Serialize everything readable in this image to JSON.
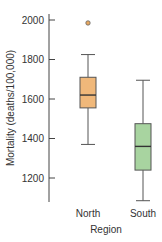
{
  "chart_data": {
    "type": "box",
    "title": "",
    "xlabel": "Region",
    "ylabel": "Mortality (deaths/100,000)",
    "ylim": [
      1080,
      2030
    ],
    "yticks": [
      1200,
      1400,
      1600,
      1800,
      2000
    ],
    "grid": false,
    "legend": null,
    "categories": [
      "North",
      "South"
    ],
    "series": [
      {
        "name": "North",
        "color": "#f0b87a",
        "whisker_low": 1370,
        "q1": 1555,
        "median": 1620,
        "q3": 1710,
        "whisker_high": 1825,
        "outliers": [
          1985
        ]
      },
      {
        "name": "South",
        "color": "#a8d4a0",
        "whisker_low": 1085,
        "q1": 1240,
        "median": 1360,
        "q3": 1475,
        "whisker_high": 1695,
        "outliers": []
      }
    ]
  },
  "colors": {
    "axis": "#444444",
    "box_stroke": "#555555",
    "median": "#333333",
    "outlier_fill": "#e8a860",
    "outlier_stroke": "#666666"
  }
}
